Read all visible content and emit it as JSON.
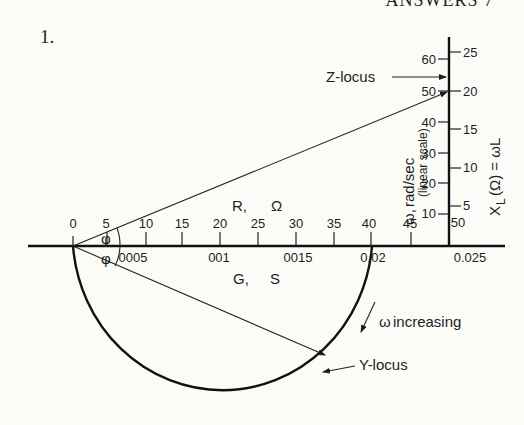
{
  "header": {
    "running_title": "ANSWERS 7"
  },
  "problem_number": "1.",
  "diagram": {
    "horizontal_axis": {
      "top_label_var": "R,",
      "top_label_unit": "Ω",
      "top_ticks": [
        "0",
        "5",
        "10",
        "15",
        "20",
        "25",
        "30",
        "35",
        "40",
        "45",
        "50"
      ],
      "bottom_label_var": "G,",
      "bottom_label_unit": "S",
      "bottom_ticks": [
        "0.005",
        "0.01",
        "0.015",
        "0.02",
        "0.025"
      ],
      "bottom_tick_display": [
        "0005",
        "001",
        "0015",
        "0.02",
        "0.025"
      ]
    },
    "vertical_axis_left": {
      "label_symbol": "ω,",
      "label_unit": "rad/sec",
      "label_note": "(linear scale)",
      "ticks": [
        "10",
        "20",
        "30",
        "40",
        "50",
        "60"
      ]
    },
    "vertical_axis_right": {
      "label": "X_L (Ω) = ωL",
      "label_x": "X",
      "label_sub": "L",
      "label_rest": "(Ω) = ωL",
      "ticks": [
        "5",
        "10",
        "15",
        "20",
        "25"
      ]
    },
    "angle_label": "φ",
    "annotations": {
      "z_locus": "Z-locus",
      "y_locus": "Y-locus",
      "omega_increasing": "ω increasing",
      "omega_symbol": "ω",
      "increasing_text": "increasing"
    }
  }
}
